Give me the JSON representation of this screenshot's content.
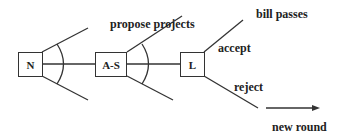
{
  "diagram": {
    "type": "game-tree",
    "nodes": [
      {
        "id": "N",
        "label": "N"
      },
      {
        "id": "A-S",
        "label": "A-S"
      },
      {
        "id": "L",
        "label": "L"
      }
    ],
    "edge_labels": {
      "propose": "propose projects",
      "accept": "accept",
      "reject": "reject",
      "bill_passes": "bill passes",
      "new_round": "new round"
    },
    "colors": {
      "line": "#333333",
      "text": "#222222",
      "background": "#ffffff"
    }
  }
}
